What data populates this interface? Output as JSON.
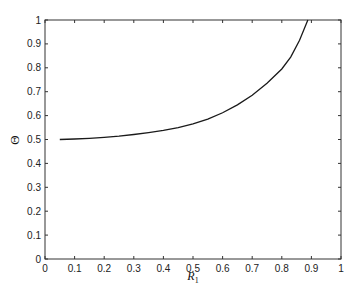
{
  "chart_data": {
    "type": "line",
    "title": "",
    "xlabel": "R",
    "xlabel_subscript": "1",
    "ylabel": "Θ",
    "xlim": [
      0,
      1
    ],
    "ylim": [
      0,
      1
    ],
    "grid": false,
    "legend": null,
    "x_ticks": [
      "0",
      "0.1",
      "0.2",
      "0.3",
      "0.4",
      "0.5",
      "0.6",
      "0.7",
      "0.8",
      "0.9",
      "1"
    ],
    "y_ticks": [
      "0",
      "0.1",
      "0.2",
      "0.3",
      "0.4",
      "0.5",
      "0.6",
      "0.7",
      "0.8",
      "0.9",
      "1"
    ],
    "series": [
      {
        "name": "Theta vs R1",
        "color": "#1a1a1a",
        "x": [
          0.05,
          0.1,
          0.15,
          0.2,
          0.25,
          0.3,
          0.35,
          0.4,
          0.45,
          0.5,
          0.55,
          0.6,
          0.65,
          0.7,
          0.75,
          0.8,
          0.83,
          0.86,
          0.888
        ],
        "y": [
          0.5,
          0.502,
          0.505,
          0.509,
          0.514,
          0.521,
          0.529,
          0.538,
          0.55,
          0.565,
          0.585,
          0.612,
          0.645,
          0.685,
          0.735,
          0.795,
          0.845,
          0.915,
          1.0
        ]
      }
    ]
  }
}
